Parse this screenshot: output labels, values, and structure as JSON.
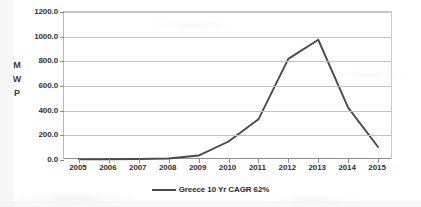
{
  "chart_data": {
    "type": "line",
    "title": "",
    "subtitle": "",
    "xlabel": "",
    "ylabel": "MWP",
    "ylabel_stacked": [
      "M",
      "W",
      "P"
    ],
    "categories": [
      "2005",
      "2006",
      "2007",
      "2008",
      "2009",
      "2010",
      "2011",
      "2012",
      "2013",
      "2014",
      "2015"
    ],
    "x": [
      2005,
      2006,
      2007,
      2008,
      2009,
      2010,
      2011,
      2012,
      2013,
      2014,
      2015
    ],
    "series": [
      {
        "name": "Greece 10 Yr CAGR 62%",
        "color": "#4a4a4a",
        "values": [
          5,
          6,
          8,
          12,
          36,
          150,
          330,
          820,
          975,
          425,
          105
        ]
      }
    ],
    "ylim": [
      0,
      1200
    ],
    "ytick_values": [
      0,
      200,
      400,
      600,
      800,
      1000,
      1200
    ],
    "ytick_labels": [
      "0.0",
      "200.0",
      "400.0",
      "600.0",
      "800.0",
      "1000.0",
      "1200.0"
    ],
    "grid": true,
    "grid_axis": "y",
    "legend_position": "bottom-center",
    "legend": [
      {
        "label": "Greece 10 Yr CAGR 62%",
        "color": "#4a4a4a",
        "marker": "line"
      }
    ],
    "annotations": []
  },
  "colors": {
    "series_line": "#4a4a4a",
    "gridline": "#c2c2c2",
    "axis": "#8f8f8f",
    "text": "#2f2f2f",
    "background": "#ffffff"
  }
}
